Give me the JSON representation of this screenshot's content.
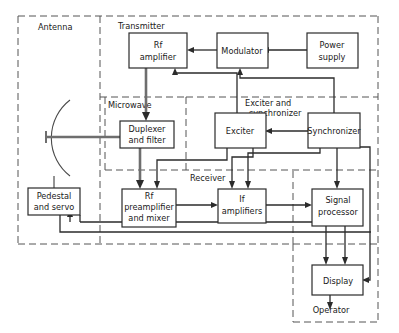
{
  "diagram": {
    "style": {
      "line_color": "#2b2b2b",
      "box_fill": "#ffffff",
      "box_stroke": "#2b2b2b",
      "dashed_color": "#555555",
      "background": "#ffffff"
    },
    "regions": [
      {
        "id": "antenna",
        "label": "Antenna"
      },
      {
        "id": "transmitter",
        "label": "Transmitter"
      },
      {
        "id": "microwave",
        "label": "Microwave"
      },
      {
        "id": "exciter_sync",
        "label": "Exciter and\nsynchronizer",
        "line1": "Exciter and",
        "line2": "synchronizer"
      },
      {
        "id": "receiver",
        "label": "Receiver"
      }
    ],
    "blocks": [
      {
        "id": "rf_amplifier",
        "line1": "Rf",
        "line2": "amplifier"
      },
      {
        "id": "modulator",
        "line1": "Modulator",
        "line2": ""
      },
      {
        "id": "power_supply",
        "line1": "Power",
        "line2": "supply"
      },
      {
        "id": "duplexer",
        "line1": "Duplexer",
        "line2": "and filter"
      },
      {
        "id": "exciter",
        "line1": "Exciter",
        "line2": ""
      },
      {
        "id": "synchronizer",
        "line1": "Synchronizer",
        "line2": ""
      },
      {
        "id": "rf_preamplifier",
        "line1": "Rf",
        "line2": "preamplifier",
        "line3": "and mixer"
      },
      {
        "id": "if_amplifiers",
        "line1": "If",
        "line2": "amplifiers"
      },
      {
        "id": "signal_processor",
        "line1": "Signal",
        "line2": "processor"
      },
      {
        "id": "pedestal",
        "line1": "Pedestal",
        "line2": "and servo"
      },
      {
        "id": "display",
        "line1": "Display",
        "line2": ""
      }
    ],
    "terminal": {
      "id": "operator",
      "label": "Operator"
    }
  }
}
